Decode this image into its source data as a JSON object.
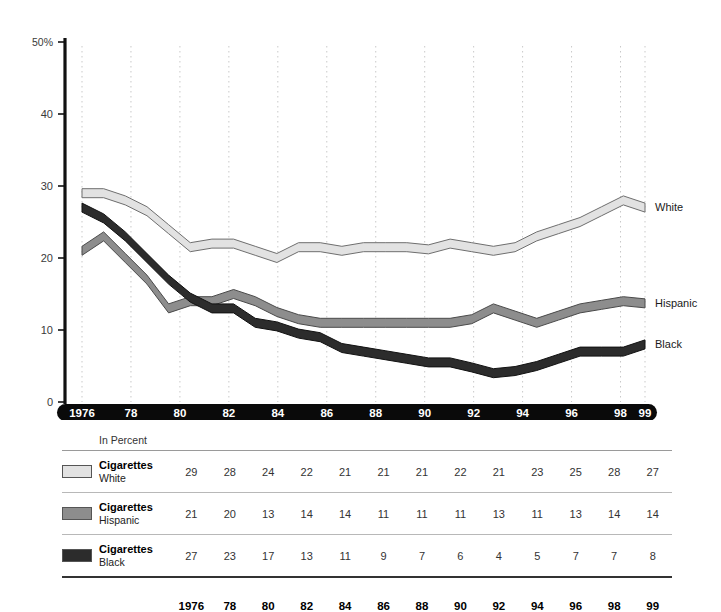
{
  "chart_data": {
    "type": "line",
    "title": "",
    "xlabel": "",
    "ylabel": "",
    "unit_note": "In Percent",
    "ylim": [
      0,
      50
    ],
    "yticks": [
      0,
      10,
      20,
      30,
      40,
      50
    ],
    "ytick_labels": [
      "0",
      "10",
      "20",
      "30",
      "40",
      "50%"
    ],
    "grid": "vertical-dotted",
    "legend_position": "right-inline",
    "categories": [
      "1976",
      "78",
      "80",
      "82",
      "84",
      "86",
      "88",
      "90",
      "92",
      "94",
      "96",
      "98",
      "99"
    ],
    "series": [
      {
        "name": "Cigarettes",
        "group": "White",
        "label": "White",
        "color": "#e2e2e2",
        "stroke": "#6e6e6e",
        "values": [
          29,
          28,
          24,
          22,
          21,
          21,
          21,
          22,
          21,
          23,
          25,
          28,
          27
        ],
        "detail_values": [
          29,
          29,
          28,
          26.5,
          24,
          21.5,
          22,
          22,
          21,
          20,
          21.5,
          21.5,
          21,
          21.5,
          21.5,
          21.5,
          21.2,
          22,
          21.5,
          21,
          21.5,
          23,
          24,
          25,
          26.5,
          28,
          27
        ]
      },
      {
        "name": "Cigarettes",
        "group": "Hispanic",
        "label": "Hispanic",
        "color": "#8d8d8d",
        "stroke": "#4a4a4a",
        "values": [
          21,
          20,
          13,
          14,
          14,
          11,
          11,
          11,
          13,
          11,
          13,
          14,
          14
        ],
        "detail_values": [
          21,
          23,
          20,
          17,
          13,
          14,
          14,
          15,
          14,
          12.5,
          11.5,
          11,
          11,
          11,
          11,
          11,
          11,
          11,
          11.5,
          13,
          12,
          11,
          12,
          13,
          13.5,
          14,
          13.7
        ]
      },
      {
        "name": "Cigarettes",
        "group": "Black",
        "label": "Black",
        "color": "#2c2c2c",
        "stroke": "#111111",
        "values": [
          27,
          23,
          17,
          13,
          11,
          9,
          7,
          6,
          4,
          5,
          7,
          7,
          8
        ],
        "detail_values": [
          27,
          25.5,
          23,
          20,
          17,
          14.5,
          13,
          13,
          11,
          10.5,
          9.5,
          9,
          7.5,
          7,
          6.5,
          6,
          5.5,
          5.5,
          4.8,
          4,
          4.3,
          5,
          6,
          7,
          7,
          7,
          8
        ]
      }
    ]
  },
  "table": {
    "unit_label": "In Percent",
    "year_header": [
      "1976",
      "78",
      "80",
      "82",
      "84",
      "86",
      "88",
      "90",
      "92",
      "94",
      "96",
      "98",
      "99"
    ],
    "rows": [
      {
        "name": "Cigarettes",
        "group": "White",
        "swatch_color": "#e2e2e2",
        "values": [
          "29",
          "28",
          "24",
          "22",
          "21",
          "21",
          "21",
          "22",
          "21",
          "23",
          "25",
          "28",
          "27"
        ]
      },
      {
        "name": "Cigarettes",
        "group": "Hispanic",
        "swatch_color": "#8d8d8d",
        "values": [
          "21",
          "20",
          "13",
          "14",
          "14",
          "11",
          "11",
          "11",
          "13",
          "11",
          "13",
          "14",
          "14"
        ]
      },
      {
        "name": "Cigarettes",
        "group": "Black",
        "swatch_color": "#2c2c2c",
        "values": [
          "27",
          "23",
          "17",
          "13",
          "11",
          "9",
          "7",
          "6",
          "4",
          "5",
          "7",
          "7",
          "8"
        ]
      }
    ]
  },
  "colors": {
    "axis": "#111111",
    "gridline": "#c9c9c9",
    "xaxis_bar": "#0a0a0a",
    "xaxis_text": "#ffffff"
  }
}
